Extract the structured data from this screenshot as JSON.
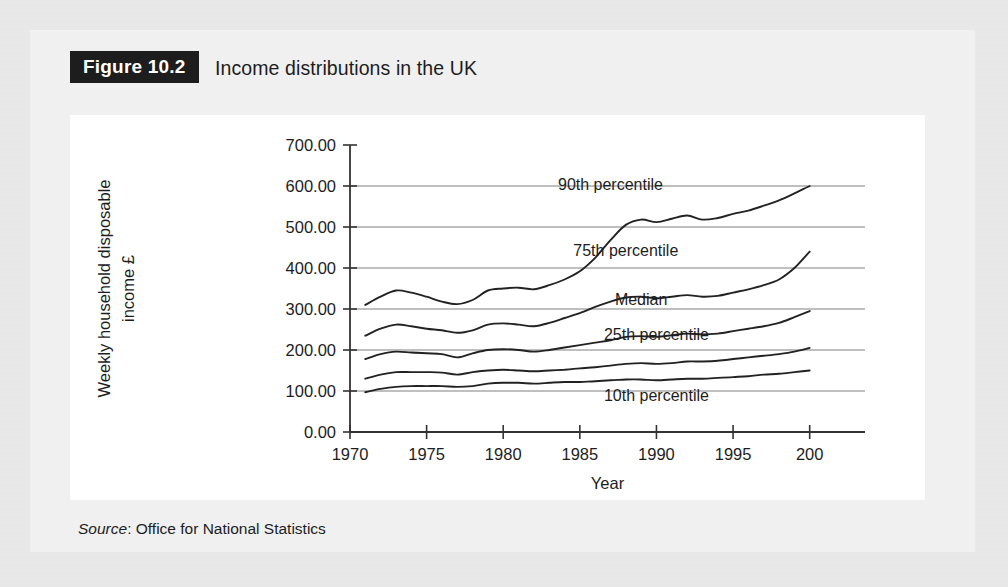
{
  "figure": {
    "badge": "Figure 10.2",
    "title": "Income distributions in the UK",
    "source_word": "Source",
    "source_rest": ": Office for National Statistics"
  },
  "colors": {
    "page_background": "#e9e9e9",
    "panel_background": "#f0f0f0",
    "chart_background": "#ffffff",
    "badge_background": "#1d1d1d",
    "badge_text": "#ffffff",
    "line": "#222222",
    "gridline": "#808080",
    "text": "#1d1d1d"
  },
  "chart_data": {
    "type": "line",
    "title": "Income distributions in the UK",
    "xlabel": "Year",
    "ylabel": "Weekly household disposable income £",
    "ylabel_line1": "Weekly household disposable",
    "ylabel_line2": "income £",
    "xlim": [
      1970,
      2001
    ],
    "ylim": [
      0,
      700
    ],
    "grid": true,
    "grid_axis": "y",
    "legend_position": "inline-annotations",
    "ytick_labels": [
      "700.00",
      "600.00",
      "500.00",
      "400.00",
      "300.00",
      "200.00",
      "100.00",
      "0.00"
    ],
    "ytick_values": [
      700,
      600,
      500,
      400,
      300,
      200,
      100,
      0
    ],
    "gridline_values": [
      600,
      500,
      400,
      300,
      200,
      100
    ],
    "xtick_labels": [
      "1970",
      "1975",
      "1980",
      "1985",
      "1990",
      "1995",
      "200"
    ],
    "xtick_values": [
      1970,
      1975,
      1980,
      1985,
      1990,
      1995,
      2000
    ],
    "x": [
      1971,
      1972,
      1973,
      1974,
      1975,
      1976,
      1977,
      1978,
      1979,
      1980,
      1981,
      1982,
      1983,
      1984,
      1985,
      1986,
      1987,
      1988,
      1989,
      1990,
      1991,
      1992,
      1993,
      1994,
      1995,
      1996,
      1997,
      1998,
      1999,
      2000
    ],
    "series": [
      {
        "name": "90th percentile",
        "label": "90th percentile",
        "values": [
          310,
          330,
          345,
          340,
          330,
          318,
          312,
          322,
          345,
          350,
          352,
          348,
          358,
          372,
          392,
          425,
          468,
          505,
          518,
          512,
          520,
          528,
          518,
          522,
          532,
          540,
          552,
          565,
          582,
          600
        ]
      },
      {
        "name": "75th percentile",
        "label": "75th percentile",
        "values": [
          235,
          252,
          262,
          258,
          252,
          248,
          242,
          248,
          262,
          265,
          262,
          258,
          266,
          278,
          290,
          305,
          318,
          328,
          330,
          326,
          330,
          334,
          330,
          332,
          340,
          348,
          358,
          372,
          400,
          440
        ]
      },
      {
        "name": "Median",
        "label": "Median",
        "values": [
          178,
          190,
          196,
          194,
          192,
          190,
          182,
          192,
          200,
          202,
          200,
          196,
          200,
          206,
          212,
          218,
          224,
          232,
          234,
          232,
          236,
          240,
          238,
          240,
          246,
          252,
          258,
          266,
          280,
          295
        ]
      },
      {
        "name": "25th percentile",
        "label": "25th percentile",
        "values": [
          130,
          140,
          146,
          146,
          146,
          145,
          140,
          146,
          150,
          152,
          150,
          148,
          150,
          152,
          155,
          158,
          162,
          166,
          168,
          166,
          168,
          172,
          172,
          174,
          178,
          182,
          186,
          190,
          196,
          205
        ]
      },
      {
        "name": "10th percentile",
        "label": "10th percentile",
        "values": [
          97,
          105,
          110,
          112,
          112,
          112,
          110,
          112,
          118,
          120,
          120,
          118,
          120,
          122,
          122,
          124,
          126,
          128,
          128,
          126,
          128,
          130,
          130,
          132,
          134,
          136,
          140,
          142,
          146,
          150
        ]
      }
    ],
    "annotations": [
      {
        "text": "90th percentile",
        "x": 1987,
        "y": 590
      },
      {
        "text": "75th percentile",
        "x": 1988,
        "y": 430
      },
      {
        "text": "Median",
        "x": 1989,
        "y": 310
      },
      {
        "text": "25th percentile",
        "x": 1990,
        "y": 225
      },
      {
        "text": "10th percentile",
        "x": 1990,
        "y": 75
      }
    ]
  }
}
